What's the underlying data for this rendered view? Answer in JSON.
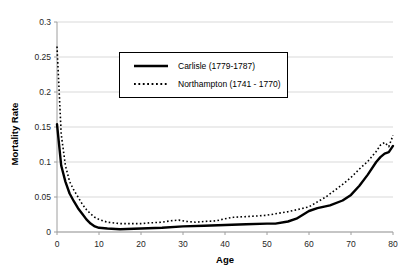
{
  "figure": {
    "background": "#ffffff",
    "gridline_color": "#d9d9d9",
    "axis_color": "#9e9e9e",
    "text_color": "#262626"
  },
  "chart_data": {
    "type": "line",
    "title": "",
    "xlabel": "Age",
    "ylabel": "Mortality Rate",
    "xlim": [
      0,
      80
    ],
    "ylim": [
      0,
      0.3
    ],
    "xticks": [
      0,
      10,
      20,
      30,
      40,
      50,
      60,
      70,
      80
    ],
    "yticks": [
      0,
      0.05,
      0.1,
      0.15,
      0.2,
      0.25,
      0.3
    ],
    "ytick_labels": [
      "0",
      "0.05",
      "0.1",
      "0.15",
      "0.2",
      "0.25",
      "0.3"
    ],
    "grid": "horizontal",
    "legend_position": "upper-center-inside",
    "series": [
      {
        "name": "Carlisle (1779-1787)",
        "style": "solid",
        "color": "#000000",
        "width": 2.4,
        "x": [
          0,
          1,
          2,
          3,
          4,
          5,
          6,
          7,
          8,
          9,
          10,
          12,
          15,
          20,
          25,
          30,
          35,
          40,
          45,
          50,
          52,
          55,
          57,
          60,
          62,
          65,
          68,
          70,
          72,
          74,
          76,
          77,
          78,
          79,
          80
        ],
        "values": [
          0.154,
          0.095,
          0.072,
          0.055,
          0.044,
          0.034,
          0.026,
          0.018,
          0.012,
          0.008,
          0.006,
          0.005,
          0.004,
          0.005,
          0.006,
          0.008,
          0.009,
          0.01,
          0.011,
          0.012,
          0.012,
          0.015,
          0.019,
          0.03,
          0.034,
          0.038,
          0.045,
          0.053,
          0.066,
          0.082,
          0.1,
          0.107,
          0.112,
          0.114,
          0.123
        ]
      },
      {
        "name": "Northampton (1741 - 1770)",
        "style": "dotted",
        "color": "#000000",
        "width": 1.6,
        "x": [
          0,
          1,
          2,
          3,
          4,
          5,
          6,
          7,
          8,
          9,
          10,
          12,
          15,
          18,
          20,
          22,
          25,
          27,
          29,
          31,
          33,
          35,
          38,
          40,
          42,
          45,
          48,
          50,
          52,
          55,
          58,
          60,
          62,
          64,
          66,
          68,
          70,
          72,
          74,
          76,
          77,
          78,
          79,
          80
        ],
        "values": [
          0.265,
          0.14,
          0.095,
          0.072,
          0.06,
          0.05,
          0.04,
          0.032,
          0.026,
          0.021,
          0.018,
          0.014,
          0.012,
          0.012,
          0.012,
          0.013,
          0.014,
          0.016,
          0.017,
          0.015,
          0.014,
          0.015,
          0.016,
          0.019,
          0.021,
          0.022,
          0.023,
          0.024,
          0.026,
          0.029,
          0.033,
          0.036,
          0.043,
          0.05,
          0.059,
          0.068,
          0.078,
          0.09,
          0.101,
          0.115,
          0.124,
          0.128,
          0.122,
          0.138
        ]
      }
    ]
  }
}
